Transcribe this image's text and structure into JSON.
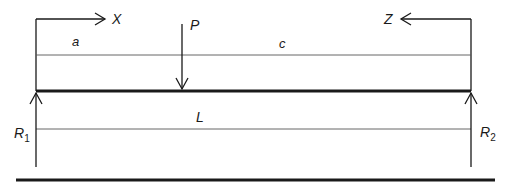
{
  "diagram": {
    "type": "simply-supported-beam-point-load",
    "colors": {
      "background": "#ffffff",
      "stroke": "#1a1a1a",
      "dimension_line": "#555555"
    },
    "labels": {
      "x_axis": "X",
      "z_axis": "Z",
      "load": "P",
      "dim_a": "a",
      "dim_c": "c",
      "dim_L": "L",
      "r1_main": "R",
      "r1_sub": "1",
      "r2_main": "R",
      "r2_sub": "2"
    }
  }
}
